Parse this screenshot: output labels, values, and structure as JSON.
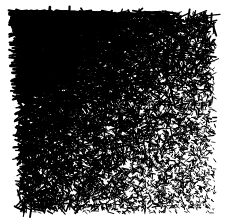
{
  "figure": {
    "title": "",
    "background_color": "#ffffff",
    "ink_color": "#000000",
    "width": 227,
    "height": 223
  },
  "chart_data": {
    "type": "scatter",
    "title": "",
    "subtitle": "",
    "xlabel": "",
    "ylabel": "",
    "legend": [],
    "annotations": [],
    "grid": false,
    "axes_visible": false,
    "tick_labels_x": [],
    "tick_labels_y": [],
    "xlim": [
      18,
      215
    ],
    "ylim": [
      12,
      213
    ],
    "plot_area": {
      "x": 18,
      "y": 12,
      "width": 197,
      "height": 201
    },
    "mark": {
      "shape": "line-segment",
      "color": "#000000",
      "orientation": "random",
      "orientation_bias_top_left_degrees": 0
    },
    "gradient": {
      "axis": "diagonal",
      "origin_corner": "top-left",
      "terminal_corner": "bottom-right",
      "density_at_origin": 1.0,
      "density_at_terminal": 0.32,
      "length_at_origin_px": 13,
      "length_at_terminal_px": 1.6,
      "thickness_at_origin_px": 2.1,
      "thickness_at_terminal_px": 0.7
    },
    "total_marks": 14000,
    "random_seed": 20250131,
    "regions": [
      {
        "name": "top-left",
        "x": 18,
        "y": 12,
        "width": 66,
        "height": 67,
        "density": 1.0,
        "mean_length_px": 12.0,
        "mean_angle_degrees": 4,
        "angle_spread_degrees": 26
      },
      {
        "name": "top-center",
        "x": 84,
        "y": 12,
        "width": 66,
        "height": 67,
        "density": 0.86,
        "mean_length_px": 8.5,
        "mean_angle_degrees": 8,
        "angle_spread_degrees": 44
      },
      {
        "name": "top-right",
        "x": 150,
        "y": 12,
        "width": 65,
        "height": 67,
        "density": 0.55,
        "mean_length_px": 4.0,
        "mean_angle_degrees": 0,
        "angle_spread_degrees": 90
      },
      {
        "name": "middle-left",
        "x": 18,
        "y": 79,
        "width": 66,
        "height": 67,
        "density": 0.84,
        "mean_length_px": 7.5,
        "mean_angle_degrees": 0,
        "angle_spread_degrees": 90
      },
      {
        "name": "center",
        "x": 84,
        "y": 79,
        "width": 66,
        "height": 67,
        "density": 0.68,
        "mean_length_px": 5.2,
        "mean_angle_degrees": 0,
        "angle_spread_degrees": 90
      },
      {
        "name": "middle-right",
        "x": 150,
        "y": 79,
        "width": 65,
        "height": 67,
        "density": 0.45,
        "mean_length_px": 3.0,
        "mean_angle_degrees": 0,
        "angle_spread_degrees": 90
      },
      {
        "name": "bottom-left",
        "x": 18,
        "y": 146,
        "width": 66,
        "height": 67,
        "density": 0.62,
        "mean_length_px": 4.6,
        "mean_angle_degrees": 0,
        "angle_spread_degrees": 90
      },
      {
        "name": "bottom-center",
        "x": 84,
        "y": 146,
        "width": 66,
        "height": 67,
        "density": 0.5,
        "mean_length_px": 3.2,
        "mean_angle_degrees": 0,
        "angle_spread_degrees": 90
      },
      {
        "name": "bottom-right",
        "x": 150,
        "y": 146,
        "width": 65,
        "height": 67,
        "density": 0.34,
        "mean_length_px": 1.9,
        "mean_angle_degrees": 0,
        "angle_spread_degrees": 90
      }
    ]
  }
}
